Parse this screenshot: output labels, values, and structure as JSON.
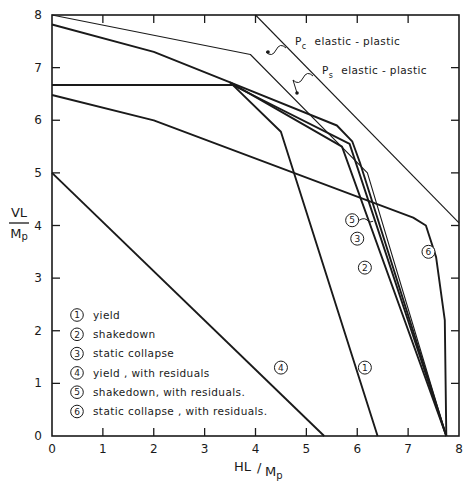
{
  "chart_data": {
    "type": "line",
    "title": "",
    "xlabel": "HL / Mp",
    "ylabel": "VL / Mp",
    "xlim": [
      0,
      8
    ],
    "ylim": [
      0,
      8
    ],
    "grid": false,
    "xticks": [
      "0",
      "1",
      "2",
      "3",
      "4",
      "5",
      "6",
      "7",
      "8"
    ],
    "yticks": [
      "0",
      "1",
      "2",
      "3",
      "4",
      "5",
      "6",
      "7",
      "8"
    ],
    "legend_position": "lower-left inside",
    "legend": [
      {
        "id": "1",
        "label": "yield"
      },
      {
        "id": "2",
        "label": "shakedown"
      },
      {
        "id": "3",
        "label": "static collapse"
      },
      {
        "id": "4",
        "label": "yield , with residuals"
      },
      {
        "id": "5",
        "label": "shakedown, with residuals."
      },
      {
        "id": "6",
        "label": "static collapse , with residuals."
      }
    ],
    "annotations": [
      {
        "symbol": "P",
        "subscript": "c",
        "text": "elastic - plastic"
      },
      {
        "symbol": "P",
        "subscript": "s",
        "text": "elastic - plastic"
      }
    ],
    "series": [
      {
        "name": "Pc elastic-plastic",
        "style": "thin",
        "points": [
          [
            4.0,
            8.0
          ],
          [
            8.0,
            4.05
          ]
        ]
      },
      {
        "name": "Ps elastic-plastic",
        "style": "thin",
        "points": [
          [
            0,
            8.0
          ],
          [
            3.9,
            7.25
          ],
          [
            6.2,
            5.0
          ],
          [
            7.75,
            0
          ]
        ]
      },
      {
        "name": "3 static collapse",
        "style": "thick",
        "points": [
          [
            0,
            7.82
          ],
          [
            2.0,
            7.3
          ],
          [
            3.5,
            6.72
          ],
          [
            5.6,
            5.9
          ],
          [
            5.9,
            5.6
          ],
          [
            6.05,
            5.2
          ],
          [
            7.75,
            0
          ]
        ]
      },
      {
        "name": "horizontal 6.65",
        "style": "thick",
        "points": [
          [
            0,
            6.67
          ],
          [
            3.55,
            6.67
          ]
        ]
      },
      {
        "name": "2 shakedown",
        "style": "thick",
        "points": [
          [
            3.5,
            6.72
          ],
          [
            5.7,
            5.5
          ],
          [
            7.75,
            0
          ]
        ]
      },
      {
        "name": "5 shakedown, with residuals",
        "style": "thick",
        "points": [
          [
            3.55,
            6.67
          ],
          [
            5.85,
            5.55
          ],
          [
            7.75,
            0
          ]
        ]
      },
      {
        "name": "1 yield",
        "style": "thick",
        "points": [
          [
            3.5,
            6.72
          ],
          [
            4.5,
            5.78
          ],
          [
            6.4,
            0
          ]
        ]
      },
      {
        "name": "6 static collapse, with residuals",
        "style": "thick",
        "points": [
          [
            0,
            6.48
          ],
          [
            2.0,
            6.0
          ],
          [
            7.1,
            4.15
          ],
          [
            7.35,
            4.0
          ],
          [
            7.55,
            3.4
          ],
          [
            7.72,
            2.2
          ],
          [
            7.75,
            0
          ]
        ]
      },
      {
        "name": "4 yield, with residuals",
        "style": "thick",
        "points": [
          [
            0,
            5.0
          ],
          [
            5.35,
            0
          ]
        ]
      }
    ],
    "curve_labels": [
      {
        "id": "1",
        "x": 6.15,
        "y": 1.3
      },
      {
        "id": "2",
        "x": 6.15,
        "y": 3.2
      },
      {
        "id": "3",
        "x": 6.0,
        "y": 3.75
      },
      {
        "id": "4",
        "x": 4.5,
        "y": 1.3
      },
      {
        "id": "5",
        "x": 5.9,
        "y": 4.1
      },
      {
        "id": "6",
        "x": 7.4,
        "y": 3.5
      }
    ]
  }
}
